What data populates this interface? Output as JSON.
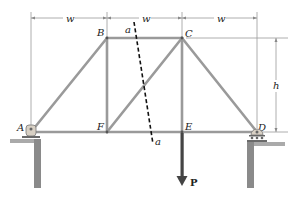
{
  "diagram": {
    "type": "truss",
    "joints": {
      "A": {
        "label": "A",
        "x": 31,
        "y": 132
      },
      "B": {
        "label": "B",
        "x": 107,
        "y": 38
      },
      "C": {
        "label": "C",
        "x": 182,
        "y": 38
      },
      "D": {
        "label": "D",
        "x": 257,
        "y": 132
      },
      "E": {
        "label": "E",
        "x": 182,
        "y": 132
      },
      "F": {
        "label": "F",
        "x": 107,
        "y": 132
      }
    },
    "members": [
      "AB",
      "BC",
      "BF",
      "AF",
      "FE",
      "ED",
      "FC",
      "CE",
      "CD"
    ],
    "dimensions": {
      "span_labels": [
        "w",
        "w",
        "w"
      ],
      "height_label": "h"
    },
    "section": {
      "label_top": "a",
      "label_bottom": "a"
    },
    "load": {
      "label": "P",
      "at": "E",
      "direction": "down"
    },
    "supports": {
      "A": "pin",
      "D": "roller"
    },
    "colors": {
      "member": "#9a9a9a",
      "dimension": "#888888",
      "load_arrow": "#444444",
      "section_line": "#111111",
      "ground": "#777777"
    }
  }
}
